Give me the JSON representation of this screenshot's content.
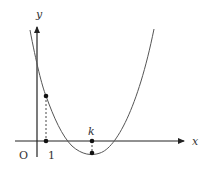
{
  "diagram": {
    "type": "function-graph",
    "colors": {
      "axis": "#222222",
      "curve": "#555555",
      "dashed": "#333333",
      "point": "#111111",
      "text": "#333333"
    },
    "labels": {
      "y_axis": "y",
      "x_axis": "x",
      "origin": "O",
      "tick_one": "1",
      "tick_k": "k"
    },
    "points": [
      {
        "name": "point-on-x-axis-at-1",
        "label": "1"
      },
      {
        "name": "point-on-curve-at-1",
        "label": ""
      },
      {
        "name": "point-on-x-axis-at-k",
        "label": "k"
      },
      {
        "name": "curve-minimum-at-k",
        "label": ""
      }
    ]
  }
}
